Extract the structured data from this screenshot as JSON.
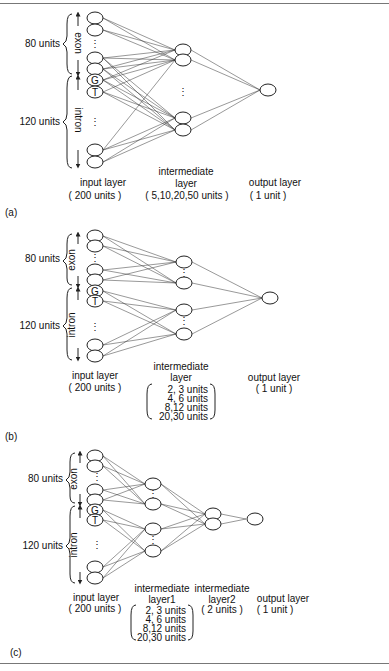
{
  "figure": {
    "panels": [
      {
        "id": "a",
        "caption": "(a)",
        "brackets": {
          "top_label": "80 units",
          "bottom_label": "120 units",
          "exon": "exon",
          "intron": "intron"
        },
        "input_markers": [
          "G",
          "T"
        ],
        "input_layer": {
          "title": "input layer",
          "units": "( 200 units )"
        },
        "hidden_layers": [
          {
            "title_line1": "intermediate",
            "title_line2": "layer",
            "units": [
              "( 5,10,20,50 units )"
            ]
          }
        ],
        "output_layer": {
          "title": "output layer",
          "units": "( 1 unit )"
        }
      },
      {
        "id": "b",
        "caption": "(b)",
        "brackets": {
          "top_label": "80 units",
          "bottom_label": "120 units",
          "exon": "exon",
          "intron": "intron"
        },
        "input_markers": [
          "G",
          "T"
        ],
        "input_layer": {
          "title": "input layer",
          "units": "( 200 units )"
        },
        "hidden_layers": [
          {
            "title_line1": "intermediate",
            "title_line2": "layer",
            "units": [
              "2,  3 units",
              "4,  6 units",
              "8,12 units",
              "20,30 units"
            ]
          }
        ],
        "output_layer": {
          "title": "output layer",
          "units": "( 1 unit )"
        }
      },
      {
        "id": "c",
        "caption": "(c)",
        "brackets": {
          "top_label": "80 units",
          "bottom_label": "120 units",
          "exon": "exon",
          "intron": "intron"
        },
        "input_markers": [
          "G",
          "T"
        ],
        "input_layer": {
          "title": "input layer",
          "units": "( 200 units )"
        },
        "hidden_layers": [
          {
            "title_line1": "intermediate",
            "title_line2": "layer1",
            "units": [
              "2,  3 units",
              "4,  6 units",
              "8,12 units",
              "20,30 units"
            ]
          },
          {
            "title_line1": "intermediate",
            "title_line2": "layer2",
            "units": [
              "( 2 units )"
            ]
          }
        ],
        "output_layer": {
          "title": "output layer",
          "units": "( 1 unit )"
        }
      }
    ],
    "ellipsis": "⋮"
  }
}
